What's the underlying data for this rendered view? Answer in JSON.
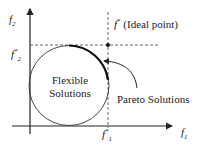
{
  "axes": {
    "x_label": "f",
    "x_sub": "1",
    "y_label": "f",
    "y_sub": "2"
  },
  "ticks": {
    "x_ideal": "f",
    "x_ideal_sub": "1",
    "x_ideal_sup": "*",
    "y_ideal": "f",
    "y_ideal_sub": "2",
    "y_ideal_sup": "*"
  },
  "annotations": {
    "ideal_point_f": "f",
    "ideal_point_sup": "*",
    "ideal_point_text": "(Ideal point)",
    "flexible_line1": "Flexible",
    "flexible_line2": "Solutions",
    "pareto": "Pareto Solutions"
  },
  "colors": {
    "line": "#222222",
    "dashed": "#444444"
  }
}
